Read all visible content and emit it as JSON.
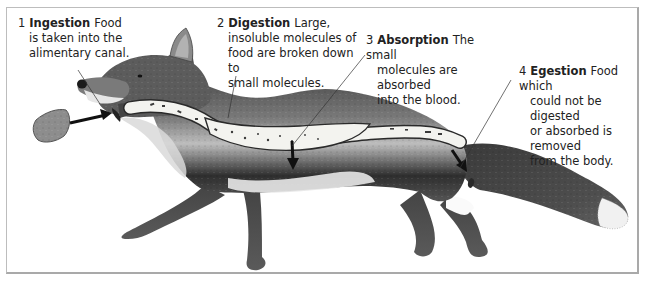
{
  "diagram": {
    "process": "digestive system stages",
    "stages": [
      {
        "number": "1",
        "term": "Ingestion",
        "description_lines": [
          "Food",
          "is taken into the",
          "alimentary canal."
        ]
      },
      {
        "number": "2",
        "term": "Digestion",
        "description_lines": [
          "Large,",
          "insoluble molecules of",
          "food are broken down to",
          "small molecules."
        ]
      },
      {
        "number": "3",
        "term": "Absorption",
        "description_lines": [
          "The small",
          "molecules are absorbed",
          "into the blood."
        ]
      },
      {
        "number": "4",
        "term": "Egestion",
        "description_lines": [
          "Food which",
          "could not be digested",
          "or absorbed is removed",
          "from the body."
        ]
      }
    ],
    "colors": {
      "fur_dark": "#3a3a3a",
      "fur_mid": "#6e6e6e",
      "fur_light": "#c9c9c9",
      "gut_fill": "#f2f2ee",
      "frame_border": "#b5b5b5",
      "text": "#222222"
    }
  }
}
